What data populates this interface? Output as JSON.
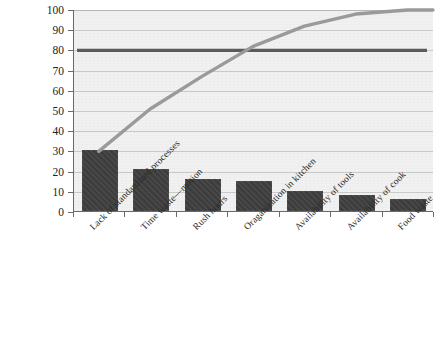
{
  "chart_data": {
    "type": "bar",
    "title": "",
    "subtitle": "",
    "xlabel": "",
    "ylabel": "",
    "ylim": [
      0,
      100
    ],
    "ytick_labels": [
      "100",
      "90",
      "80",
      "70",
      "60",
      "50",
      "40",
      "30",
      "20",
      "10",
      "0"
    ],
    "ytick_values": [
      100,
      90,
      80,
      70,
      60,
      50,
      40,
      30,
      20,
      10,
      0
    ],
    "grid": true,
    "legend": "none",
    "categories": [
      "Lack of standardized processes",
      "Time waste—motion",
      "Rush hours",
      "Oraganization in kitchen",
      "Availability of tools",
      "Availability of cook",
      "Food waste"
    ],
    "values": [
      30,
      21,
      16,
      15,
      10,
      8,
      6
    ],
    "series": [
      {
        "name": "Frequency",
        "type": "bar",
        "values": [
          30,
          21,
          16,
          15,
          10,
          8,
          6
        ],
        "color": "#3f3f3f"
      },
      {
        "name": "Cumulative percentage",
        "type": "line",
        "values": [
          30,
          51,
          67,
          82,
          92,
          98,
          100
        ],
        "color": "#9a9a9a"
      }
    ],
    "reference_line": {
      "name": "80% threshold",
      "value": 80,
      "color": "#5c5c5c"
    },
    "colors": {
      "bar": "#3f3f3f",
      "cumulative_line": "#9a9a9a",
      "reference_line": "#5c5c5c",
      "plot_background": "#f1f1f1",
      "gridline": "#c9c9c9",
      "axis": "#6a6a6a",
      "text": "#232323"
    }
  }
}
